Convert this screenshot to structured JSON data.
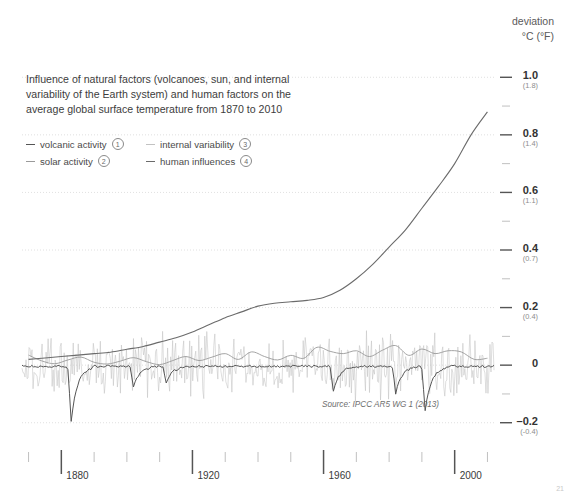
{
  "axis_header": {
    "line1": "deviation",
    "line2": "°C (°F)"
  },
  "caption": "Influence of natural factors (volcanoes, sun, and internal variability of the Earth system) and human factors on the average global surface temperature from 1870 to 2010",
  "source": "Source: IPCC AR5 WG 1 (2013)",
  "corner_mark": "21",
  "legend": [
    {
      "label": "volcanic activity",
      "number": "①",
      "num_text": "1",
      "color": "#555555",
      "key": "volcanic"
    },
    {
      "label": "internal variability",
      "number": "③",
      "num_text": "3",
      "color": "#c2c2c2",
      "key": "internal"
    },
    {
      "label": "solar activity",
      "number": "②",
      "num_text": "2",
      "color": "#9a9a9a",
      "key": "solar"
    },
    {
      "label": "human influences",
      "number": "④",
      "num_text": "4",
      "color": "#6b6b6b",
      "key": "human"
    }
  ],
  "chart_data": {
    "type": "line",
    "title": "Influence of natural factors (volcanoes, sun, and internal variability of the Earth system) and human factors on the average global surface temperature from 1870 to 2010",
    "xlabel": "",
    "ylabel": "deviation °C (°F)",
    "xlim": [
      1868,
      2012
    ],
    "ylim": [
      -0.26,
      1.06
    ],
    "grid": true,
    "legend_position": "upper-left",
    "x_major_ticks": [
      1880,
      1920,
      1960,
      2000
    ],
    "x_minor_ticks": [
      1870,
      1890,
      1900,
      1910,
      1930,
      1940,
      1950,
      1970,
      1980,
      1990,
      2010
    ],
    "y_ticks_celsius": [
      1.0,
      0.8,
      0.6,
      0.4,
      0.2,
      0,
      -0.2
    ],
    "y_ticks_fahrenheit": [
      "(1.8)",
      "(1.4)",
      "(1.1)",
      "(0.7)",
      "(0.4)",
      "",
      "(-0.4)"
    ],
    "y_tick_labels": [
      "1.0",
      "0.8",
      "0.6",
      "0.4",
      "0.2",
      "0",
      "–0.2"
    ],
    "y_minor_ticks": [
      0.9,
      0.7,
      0.5,
      0.3,
      0.1,
      -0.1
    ],
    "series": [
      {
        "name": "human influences",
        "key": "human",
        "color": "#6b6b6b",
        "width": 1.1,
        "x": [
          1870,
          1875,
          1880,
          1885,
          1890,
          1895,
          1900,
          1905,
          1910,
          1915,
          1920,
          1925,
          1930,
          1935,
          1940,
          1945,
          1950,
          1955,
          1960,
          1965,
          1970,
          1975,
          1980,
          1985,
          1990,
          1995,
          2000,
          2005,
          2010
        ],
        "values": [
          0.02,
          0.025,
          0.03,
          0.035,
          0.04,
          0.045,
          0.055,
          0.065,
          0.08,
          0.095,
          0.115,
          0.14,
          0.165,
          0.185,
          0.205,
          0.215,
          0.22,
          0.225,
          0.235,
          0.26,
          0.3,
          0.35,
          0.41,
          0.47,
          0.545,
          0.62,
          0.7,
          0.8,
          0.88
        ]
      },
      {
        "name": "solar activity",
        "key": "solar",
        "color": "#9a9a9a",
        "width": 0.9,
        "x": [
          1870,
          1874,
          1878,
          1882,
          1886,
          1890,
          1894,
          1898,
          1902,
          1906,
          1910,
          1914,
          1918,
          1922,
          1926,
          1930,
          1934,
          1938,
          1942,
          1946,
          1950,
          1954,
          1958,
          1962,
          1966,
          1970,
          1974,
          1978,
          1982,
          1986,
          1990,
          1994,
          1998,
          2002,
          2006,
          2010
        ],
        "values": [
          0.035,
          0.015,
          0.005,
          0.018,
          0.028,
          0.01,
          0.004,
          0.014,
          0.026,
          0.012,
          0.002,
          0.016,
          0.03,
          0.016,
          0.028,
          0.04,
          0.02,
          0.046,
          0.03,
          0.018,
          0.034,
          0.024,
          0.062,
          0.048,
          0.04,
          0.05,
          0.03,
          0.052,
          0.068,
          0.034,
          0.056,
          0.04,
          0.05,
          0.046,
          0.02,
          0.024
        ]
      },
      {
        "name": "volcanic activity",
        "key": "volcanic",
        "color": "#555555",
        "width": 1.0,
        "events": [
          {
            "year": 1883,
            "name": "Krakatoa",
            "depth": -0.19
          },
          {
            "year": 1902,
            "name": "Santa Maria",
            "depth": -0.075
          },
          {
            "year": 1912,
            "name": "Novarupta",
            "depth": -0.055
          },
          {
            "year": 1963,
            "name": "Agung",
            "depth": -0.085
          },
          {
            "year": 1982,
            "name": "El Chichón",
            "depth": -0.095
          },
          {
            "year": 1991,
            "name": "Pinatubo",
            "depth": -0.155
          }
        ]
      },
      {
        "name": "internal variability",
        "key": "internal",
        "color": "#c2c2c2",
        "width": 0.55,
        "description": "high-frequency year-to-year noise, amplitude roughly ±0.12 °C about zero"
      }
    ]
  }
}
